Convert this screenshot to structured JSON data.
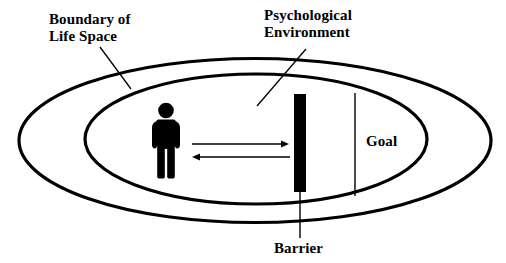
{
  "figure": {
    "type": "concept-diagram",
    "background_color": "#ffffff",
    "stroke_color": "#000000"
  },
  "labels": {
    "boundary": {
      "line1": "Boundary of",
      "line2": "Life Space"
    },
    "psychological": {
      "line1": "Psychological",
      "line2": "Environment"
    },
    "goal": "Goal",
    "barrier": "Barrier"
  },
  "shapes": {
    "outer_ellipse": {
      "name": "boundary-of-life-space",
      "cx": 255,
      "cy": 140.5,
      "rx": 236,
      "ry": 82,
      "stroke_width": 3.2
    },
    "inner_ellipse": {
      "name": "psychological-environment",
      "cx": 256,
      "cy": 139,
      "rx": 171,
      "ry": 65,
      "stroke_width": 3.2
    },
    "barrier_bar": {
      "x": 294,
      "y": 94,
      "width": 12,
      "height": 98,
      "fill": "#000000"
    },
    "goal_line": {
      "x": 355,
      "y1": 93,
      "y2": 196,
      "stroke_width": 1.4
    },
    "person": {
      "head_cx": 166,
      "head_cy": 110,
      "head_r": 7.5,
      "body_top": 120,
      "body_bottom": 178,
      "fill": "#000000"
    }
  },
  "arrows": {
    "approach": {
      "direction": "right",
      "x1": 192,
      "x2": 289,
      "y": 144
    },
    "avoid": {
      "direction": "left",
      "x1": 290,
      "x2": 192,
      "y": 157
    }
  },
  "leaders": {
    "boundary_leader": {
      "x1": 100,
      "y1": 47,
      "x2": 131,
      "y2": 89
    },
    "psychological_leader": {
      "x1": 306,
      "y1": 49,
      "x2": 257,
      "y2": 106
    },
    "barrier_leader": {
      "x1": 300,
      "y1": 192,
      "x2": 300,
      "y2": 238
    }
  }
}
